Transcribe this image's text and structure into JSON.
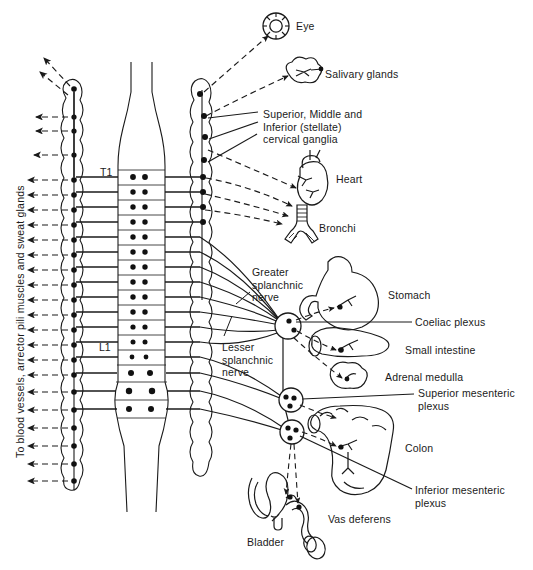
{
  "figure": {
    "title_vertical": "To blood vessels, arrector pili muscles and sweat glands",
    "spinal_markers": [
      {
        "id": "t1",
        "text": "T1"
      },
      {
        "id": "l1",
        "text": "L1"
      }
    ],
    "organ_labels": [
      {
        "id": "eye",
        "text": "Eye",
        "x": 296,
        "y": 20
      },
      {
        "id": "salivary-glands",
        "text": "Salivary glands",
        "x": 325,
        "y": 68
      },
      {
        "id": "cervical-ganglia",
        "text": "Superior, Middle and\nInferior (stellate)\ncervical ganglia",
        "x": 263,
        "y": 108
      },
      {
        "id": "heart",
        "text": "Heart",
        "x": 336,
        "y": 173
      },
      {
        "id": "bronchi",
        "text": "Bronchi",
        "x": 319,
        "y": 222
      },
      {
        "id": "stomach",
        "text": "Stomach",
        "x": 388,
        "y": 289
      },
      {
        "id": "coeliac-plexus",
        "text": "Coeliac plexus",
        "x": 415,
        "y": 322
      },
      {
        "id": "small-intestine",
        "text": "Small intestine",
        "x": 405,
        "y": 349
      },
      {
        "id": "adrenal-medulla",
        "text": "Adrenal medulla",
        "x": 385,
        "y": 375
      },
      {
        "id": "superior-mesenteric-plexus",
        "text": "Superior mesenteric\nplexus",
        "x": 418,
        "y": 392
      },
      {
        "id": "colon",
        "text": "Colon",
        "x": 405,
        "y": 447
      },
      {
        "id": "inferior-mesenteric-plexus",
        "text": "Inferior mesenteric\nplexus",
        "x": 415,
        "y": 490
      },
      {
        "id": "vas-deferens",
        "text": "Vas deferens",
        "x": 328,
        "y": 518
      },
      {
        "id": "bladder",
        "text": "Bladder",
        "x": 247,
        "y": 540
      }
    ],
    "nerve_labels": [
      {
        "id": "greater-splanchnic-nerve",
        "text": "Greater\nsplanchnic\nnerve",
        "x": 252,
        "y": 266
      },
      {
        "id": "lesser-splanchnic-nerve",
        "text": "Lesser\nsplanchnic\nnerve",
        "x": 222,
        "y": 345
      }
    ],
    "colors": {
      "ink": "#1a1a1a",
      "paper": "#ffffff"
    },
    "counts": {
      "thoracic_segments": 12,
      "lumbar_segments": 3,
      "left_chain_ganglia": 21,
      "right_cervical_ganglia": 4,
      "prevertebral_plexuses": 3
    }
  }
}
